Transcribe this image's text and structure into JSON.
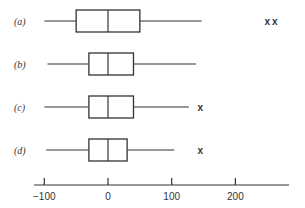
{
  "chart_data": {
    "type": "boxplot",
    "title": "",
    "xlabel": "",
    "ylabel": "",
    "xlim": [
      -110,
      290
    ],
    "xticks": [
      -100,
      0,
      100,
      200
    ],
    "xtick_labels": [
      "−100",
      "0",
      "100",
      "200"
    ],
    "grid": false,
    "outlier_marker": "x",
    "series": [
      {
        "name": "(a)",
        "whisker_low": -100,
        "q1": -50,
        "median": 0,
        "q3": 50,
        "whisker_high": 147,
        "outliers": [
          250,
          262
        ]
      },
      {
        "name": "(b)",
        "whisker_low": -95,
        "q1": -30,
        "median": 0,
        "q3": 40,
        "whisker_high": 138,
        "outliers": []
      },
      {
        "name": "(c)",
        "whisker_low": -100,
        "q1": -30,
        "median": 0,
        "q3": 40,
        "whisker_high": 127,
        "outliers": [
          145
        ]
      },
      {
        "name": "(d)",
        "whisker_low": -97,
        "q1": -30,
        "median": 0,
        "q3": 30,
        "whisker_high": 104,
        "outliers": [
          145
        ]
      }
    ]
  }
}
